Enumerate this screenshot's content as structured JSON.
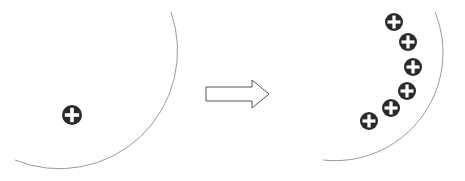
{
  "diagram": {
    "colors": {
      "background": "#ffffff",
      "surface_line": "#9a9a9a",
      "charge_fill": "#2a2a2a",
      "charge_symbol": "#ffffff",
      "arrow_stroke": "#555555"
    },
    "left_panel": {
      "label": "before",
      "surface_arc": {
        "start": [
          171,
          12
        ],
        "end": [
          15,
          160
        ],
        "radius": 118
      },
      "charges": [
        {
          "symbol": "+",
          "cx": 72,
          "cy": 115,
          "r": 10
        }
      ]
    },
    "arrow": {
      "direction": "right",
      "x": 206,
      "y": 94,
      "width": 64,
      "head": 20
    },
    "right_panel": {
      "label": "after",
      "surface_arc": {
        "start": [
          435,
          12
        ],
        "end": [
          323,
          160
        ],
        "radius": 105
      },
      "charges": [
        {
          "symbol": "+",
          "cx": 394,
          "cy": 22,
          "r": 9
        },
        {
          "symbol": "+",
          "cx": 408,
          "cy": 42,
          "r": 9
        },
        {
          "symbol": "+",
          "cx": 413,
          "cy": 67,
          "r": 9
        },
        {
          "symbol": "+",
          "cx": 407,
          "cy": 91,
          "r": 9
        },
        {
          "symbol": "+",
          "cx": 391,
          "cy": 108,
          "r": 9
        },
        {
          "symbol": "+",
          "cx": 369,
          "cy": 121,
          "r": 9
        }
      ]
    }
  }
}
